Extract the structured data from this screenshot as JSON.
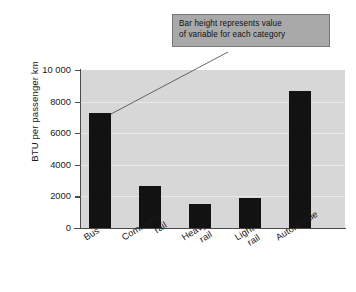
{
  "chart_data": {
    "type": "bar",
    "title": "",
    "xlabel": "",
    "ylabel": "BTU per passenger km",
    "categories": [
      "Bus",
      "Commuter rail",
      "Heavy rail",
      "Light rail",
      "Automobile"
    ],
    "values": [
      7280,
      2660,
      1520,
      1900,
      8670
    ],
    "ylim": [
      0,
      10000
    ],
    "yticks": [
      0,
      2000,
      4000,
      6000,
      8000,
      10000
    ],
    "ytick_labels": [
      "0",
      "2000",
      "4000",
      "6000",
      "8000",
      "10 000"
    ],
    "grid": true,
    "legend": false,
    "bar_color": "#121212",
    "plot_background": "#d7d7d7",
    "annotations": [
      {
        "text_line_1": "Bar height represents value",
        "text_line_2": "of variable for each category",
        "points_to": "Bus",
        "box_color": "#a9a9a9"
      }
    ]
  },
  "axis": {
    "y_title": "BTU per passenger km",
    "ticks": [
      {
        "label": "10 000",
        "value": 10000
      },
      {
        "label": "8000",
        "value": 8000
      },
      {
        "label": "6000",
        "value": 6000
      },
      {
        "label": "4000",
        "value": 4000
      },
      {
        "label": "2000",
        "value": 2000
      },
      {
        "label": "0",
        "value": 0
      }
    ]
  },
  "categories": [
    {
      "line1": "Bus",
      "line2": ""
    },
    {
      "line1": "Commuter",
      "line2": "rail"
    },
    {
      "line1": "Heavy",
      "line2": "rail"
    },
    {
      "line1": "Light",
      "line2": "rail"
    },
    {
      "line1": "Automobile",
      "line2": ""
    }
  ],
  "callout": {
    "line1": "Bar height represents value",
    "line2": "of variable for each category"
  }
}
